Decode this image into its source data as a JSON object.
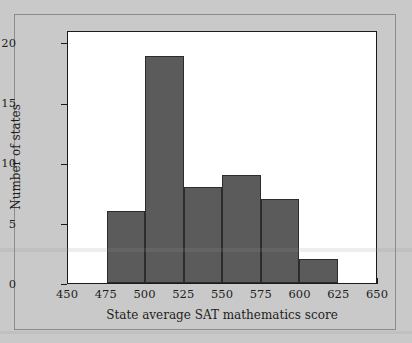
{
  "chart_data": {
    "type": "bar",
    "title": "",
    "subtitle": "",
    "xlabel": "State average SAT mathematics score",
    "ylabel": "Number of states",
    "xlim": [
      450,
      650
    ],
    "ylim": [
      0,
      21
    ],
    "grid": false,
    "legend": null,
    "bin_width": 25,
    "x_ticks": [
      450,
      475,
      500,
      525,
      550,
      575,
      600,
      625,
      650
    ],
    "x_tick_labels": [
      "450",
      "475",
      "500",
      "525",
      "550",
      "575",
      "600",
      "625",
      "650"
    ],
    "y_ticks": [
      0,
      5,
      10,
      15,
      20
    ],
    "y_tick_labels": [
      "0",
      "5",
      "10",
      "15",
      "20"
    ],
    "bin_edges": [
      475,
      500,
      525,
      550,
      575,
      600,
      625
    ],
    "categories": [
      "475-500",
      "500-525",
      "525-550",
      "550-575",
      "575-600",
      "600-625"
    ],
    "values": [
      6,
      19,
      8,
      9,
      7,
      2
    ],
    "bars": [
      {
        "label": "475-500",
        "x0": 475,
        "x1": 500,
        "value": 6
      },
      {
        "label": "500-525",
        "x0": 500,
        "x1": 525,
        "value": 19
      },
      {
        "label": "525-550",
        "x0": 525,
        "x1": 550,
        "value": 8
      },
      {
        "label": "550-575",
        "x0": 550,
        "x1": 575,
        "value": 9
      },
      {
        "label": "575-600",
        "x0": 575,
        "x1": 600,
        "value": 7
      },
      {
        "label": "600-625",
        "x0": 600,
        "x1": 625,
        "value": 2
      }
    ],
    "colors": {
      "bar_fill": "#5b5b5b",
      "bar_edge": "#2c2c2c",
      "plot_background": "#ffffff",
      "figure_background": "#c9c9c9",
      "axis": "#1a1a1a",
      "text": "#1d1d1d"
    }
  }
}
